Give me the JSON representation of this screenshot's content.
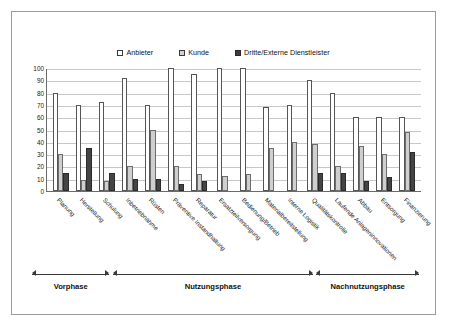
{
  "chart_data": {
    "type": "bar",
    "title": "",
    "xlabel": "",
    "ylabel": "",
    "ylim": [
      0,
      100
    ],
    "ytick_step": 10,
    "yticks": [
      100,
      90,
      80,
      70,
      60,
      50,
      40,
      30,
      20,
      10,
      0
    ],
    "grid": true,
    "legend_position": "top-center",
    "legend": [
      "Anbieter",
      "Kunde",
      "Dritte/Externe Dienstleister"
    ],
    "categories": [
      "Planung",
      "Herstellung",
      "Schulung",
      "Inbetriebnahme",
      "Rüsten",
      "Präventive Instandhaltung",
      "Reparatur",
      "Ersatzteilversorgung",
      "Bedienung/Betrieb",
      "Materialbereitstellung",
      "Interne Logistik",
      "Qualitätskontrolle",
      "Laufende Anlageninnovationen",
      "Abbau",
      "Entsorgung",
      "Finanzierung"
    ],
    "series": [
      {
        "name": "Anbieter",
        "color": "#ffffff",
        "values": [
          80,
          70,
          72,
          92,
          70,
          100,
          95,
          100,
          100,
          68,
          70,
          90,
          80,
          60,
          60,
          60
        ]
      },
      {
        "name": "Kunde",
        "color": "#cfcfcf",
        "values": [
          30,
          9,
          8,
          20,
          50,
          20,
          14,
          12,
          14,
          35,
          40,
          38,
          20,
          37,
          30,
          48
        ]
      },
      {
        "name": "Dritte/Externe Dienstleister",
        "color": "#444444",
        "values": [
          15,
          35,
          15,
          10,
          10,
          6,
          8,
          0,
          0,
          0,
          0,
          15,
          15,
          8,
          11,
          32
        ]
      }
    ]
  },
  "phases": {
    "items": [
      {
        "label": "Vorphase",
        "start_pct": 0.0,
        "end_pct": 20.0
      },
      {
        "label": "Nutzungsphase",
        "start_pct": 21.0,
        "end_pct": 72.5
      },
      {
        "label": "Nachnutzungsphase",
        "start_pct": 73.5,
        "end_pct": 100.0
      }
    ]
  }
}
